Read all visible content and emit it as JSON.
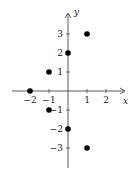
{
  "chart_data": {
    "type": "scatter",
    "title": "",
    "xlabel": "x",
    "ylabel": "y",
    "xlim": [
      -2.9,
      3
    ],
    "ylim": [
      -4,
      4
    ],
    "x_ticks": [
      -2,
      -1,
      1,
      2
    ],
    "y_ticks": [
      -3,
      -2,
      -1,
      1,
      2,
      3
    ],
    "grid": false,
    "legend": null,
    "series": [
      {
        "name": "points",
        "color": "#000000",
        "x": [
          -2,
          -1,
          -1,
          0,
          0,
          1,
          1
        ],
        "y": [
          0,
          1,
          -1,
          2,
          -2,
          3,
          -3
        ]
      }
    ]
  }
}
